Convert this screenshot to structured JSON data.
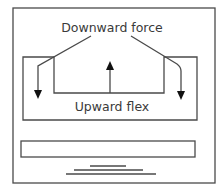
{
  "diagram": {
    "labels": {
      "top": "Downward force",
      "bottom": "Upward flex"
    },
    "colors": {
      "stroke": "#4a4a4a",
      "background": "#ffffff",
      "text": "#3a3a3a"
    },
    "elements": {
      "outer_frame": "outer-frame",
      "flex_channel": "flex-channel",
      "downward_arrows": 2,
      "upward_arrows": 1,
      "base_bar": "base-bar",
      "ground_lines": 3
    }
  }
}
